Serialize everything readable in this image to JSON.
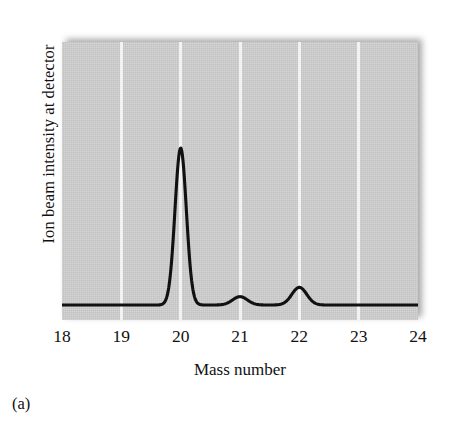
{
  "figure": {
    "caption": "(a)",
    "panel_background_color": "#c9c9c9",
    "gridline_color": "#f2f2f2",
    "curve_color": "#111111"
  },
  "chart_data": {
    "type": "line",
    "title": "",
    "subtitle": "",
    "xlabel": "Mass number",
    "ylabel": "Ion beam intensity at detector",
    "xlim": [
      18,
      24
    ],
    "ylim": [
      0,
      1.08
    ],
    "xticks": [
      18,
      19,
      20,
      21,
      22,
      23,
      24
    ],
    "xtick_labels": [
      "18",
      "19",
      "20",
      "21",
      "22",
      "23",
      "24"
    ],
    "yticks": [],
    "ytick_labels": [],
    "grid": "vertical gridlines at 19, 20, 21, 22, 23",
    "gridlines_x": [
      19,
      20,
      21,
      22,
      23
    ],
    "legend": [],
    "annotations": [],
    "series": [
      {
        "name": "Ion beam intensity",
        "description": "Mass spectrum of neon: three isotope peaks at mass numbers 20, 21 and 22 above a flat baseline",
        "baseline": 0.02,
        "peaks": [
          {
            "mass_number": 20,
            "relative_intensity": 1.0,
            "half_width": 0.13
          },
          {
            "mass_number": 21,
            "relative_intensity": 0.072,
            "half_width": 0.17
          },
          {
            "mass_number": 22,
            "relative_intensity": 0.13,
            "half_width": 0.17
          }
        ],
        "x": [
          18.0,
          18.2,
          18.4,
          18.6,
          18.8,
          19.0,
          19.2,
          19.4,
          19.6,
          19.7,
          19.8,
          19.9,
          20.0,
          20.1,
          20.2,
          20.3,
          20.4,
          20.6,
          20.8,
          21.0,
          21.2,
          21.4,
          21.6,
          21.8,
          22.0,
          22.2,
          22.4,
          22.6,
          22.8,
          23.0,
          23.5,
          24.0
        ],
        "y": [
          0.02,
          0.02,
          0.02,
          0.02,
          0.02,
          0.02,
          0.021,
          0.024,
          0.06,
          0.17,
          0.47,
          0.86,
          1.0,
          0.86,
          0.47,
          0.17,
          0.06,
          0.026,
          0.035,
          0.072,
          0.048,
          0.028,
          0.035,
          0.075,
          0.13,
          0.075,
          0.035,
          0.024,
          0.021,
          0.02,
          0.02,
          0.02
        ]
      }
    ]
  }
}
